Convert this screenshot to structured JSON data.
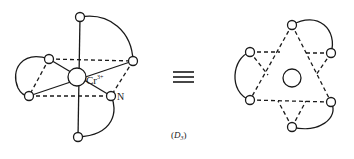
{
  "diagram": {
    "left": {
      "metal_label": "Cr",
      "metal_charge": "3+",
      "ligand_atom_label": "N"
    },
    "equivalence_symbol": "≡",
    "caption": {
      "open": "(",
      "symbol": "D",
      "subscript": "3",
      "close": ")"
    },
    "colors": {
      "stroke": "#1a1a1a",
      "background": "#ffffff"
    }
  }
}
